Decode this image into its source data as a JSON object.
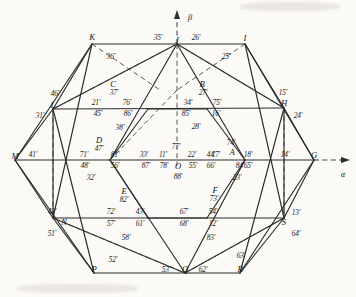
{
  "figure": {
    "type": "geometry-diagram",
    "axes": {
      "vertical": {
        "label": "β",
        "name": "beta-axis"
      },
      "horizontal": {
        "label": "α",
        "name": "alpha-axis"
      }
    },
    "vertices": [
      {
        "id": "K",
        "label": "K",
        "x": 92,
        "y": 37
      },
      {
        "id": "J",
        "label": "J",
        "x": 177,
        "y": 40
      },
      {
        "id": "I",
        "label": "I",
        "x": 245,
        "y": 38
      },
      {
        "id": "L",
        "label": "L",
        "x": 53,
        "y": 105
      },
      {
        "id": "C",
        "label": "C",
        "x": 113,
        "y": 84
      },
      {
        "id": "B",
        "label": "B",
        "x": 202,
        "y": 84
      },
      {
        "id": "H",
        "label": "H",
        "x": 284,
        "y": 103
      },
      {
        "id": "M",
        "label": "M",
        "x": 15,
        "y": 156
      },
      {
        "id": "D",
        "label": "D",
        "x": 99,
        "y": 140
      },
      {
        "id": "A",
        "label": "A",
        "x": 232,
        "y": 152
      },
      {
        "id": "O",
        "label": "O",
        "x": 178,
        "y": 166
      },
      {
        "id": "G",
        "label": "G",
        "x": 314,
        "y": 155
      },
      {
        "id": "E",
        "label": "E",
        "x": 124,
        "y": 191
      },
      {
        "id": "F",
        "label": "F",
        "x": 215,
        "y": 190
      },
      {
        "id": "N",
        "label": "N",
        "x": 64,
        "y": 222
      },
      {
        "id": "S",
        "label": "S",
        "x": 284,
        "y": 222
      },
      {
        "id": "P",
        "label": "P",
        "x": 94,
        "y": 269
      },
      {
        "id": "Q",
        "label": "Q",
        "x": 185,
        "y": 269
      },
      {
        "id": "R",
        "label": "R",
        "x": 240,
        "y": 269
      }
    ],
    "member_labels": [
      {
        "text": "35'",
        "x": 158,
        "y": 38
      },
      {
        "text": "26'",
        "x": 196,
        "y": 38
      },
      {
        "text": "36'",
        "x": 111,
        "y": 57
      },
      {
        "text": "25'",
        "x": 226,
        "y": 57
      },
      {
        "text": "37'",
        "x": 114,
        "y": 93
      },
      {
        "text": "27'",
        "x": 203,
        "y": 93
      },
      {
        "text": "46'",
        "x": 55,
        "y": 94
      },
      {
        "text": "15'",
        "x": 283,
        "y": 93
      },
      {
        "text": "21'",
        "x": 96,
        "y": 103
      },
      {
        "text": "76'",
        "x": 127,
        "y": 103
      },
      {
        "text": "34'",
        "x": 188,
        "y": 103
      },
      {
        "text": "75'",
        "x": 217,
        "y": 103
      },
      {
        "text": "31'",
        "x": 40,
        "y": 116
      },
      {
        "text": "24'",
        "x": 298,
        "y": 116
      },
      {
        "text": "45'",
        "x": 98,
        "y": 114
      },
      {
        "text": "86'",
        "x": 128,
        "y": 114
      },
      {
        "text": "85'",
        "x": 186,
        "y": 114
      },
      {
        "text": "16'",
        "x": 216,
        "y": 114
      },
      {
        "text": "38'",
        "x": 120,
        "y": 128
      },
      {
        "text": "28'",
        "x": 196,
        "y": 127
      },
      {
        "text": "47'",
        "x": 99,
        "y": 149
      },
      {
        "text": "74'",
        "x": 231,
        "y": 143
      },
      {
        "text": "77'",
        "x": 176,
        "y": 147
      },
      {
        "text": "41'",
        "x": 33,
        "y": 155
      },
      {
        "text": "71'",
        "x": 84,
        "y": 155
      },
      {
        "text": "81'",
        "x": 115,
        "y": 155
      },
      {
        "text": "33'",
        "x": 144,
        "y": 155
      },
      {
        "text": "11'",
        "x": 163,
        "y": 155
      },
      {
        "text": "22'",
        "x": 192,
        "y": 155
      },
      {
        "text": "44'",
        "x": 211,
        "y": 155
      },
      {
        "text": "17'",
        "x": 216,
        "y": 155
      },
      {
        "text": "18'",
        "x": 248,
        "y": 155
      },
      {
        "text": "14'",
        "x": 285,
        "y": 155
      },
      {
        "text": "48'",
        "x": 85,
        "y": 166
      },
      {
        "text": "56'",
        "x": 115,
        "y": 166
      },
      {
        "text": "87'",
        "x": 146,
        "y": 166
      },
      {
        "text": "78'",
        "x": 164,
        "y": 166
      },
      {
        "text": "55'",
        "x": 193,
        "y": 166
      },
      {
        "text": "66'",
        "x": 211,
        "y": 166
      },
      {
        "text": "84'",
        "x": 240,
        "y": 166
      },
      {
        "text": "65'",
        "x": 248,
        "y": 166
      },
      {
        "text": "32'",
        "x": 91,
        "y": 178
      },
      {
        "text": "88'",
        "x": 178,
        "y": 177
      },
      {
        "text": "23'",
        "x": 237,
        "y": 178
      },
      {
        "text": "82'",
        "x": 124,
        "y": 200
      },
      {
        "text": "73'",
        "x": 214,
        "y": 199
      },
      {
        "text": "42'",
        "x": 52,
        "y": 212
      },
      {
        "text": "13'",
        "x": 296,
        "y": 213
      },
      {
        "text": "72'",
        "x": 111,
        "y": 212
      },
      {
        "text": "43'",
        "x": 140,
        "y": 212
      },
      {
        "text": "67'",
        "x": 184,
        "y": 212
      },
      {
        "text": "54'",
        "x": 213,
        "y": 212
      },
      {
        "text": "57'",
        "x": 111,
        "y": 224
      },
      {
        "text": "61'",
        "x": 140,
        "y": 224
      },
      {
        "text": "68'",
        "x": 184,
        "y": 224
      },
      {
        "text": "12'",
        "x": 213,
        "y": 224
      },
      {
        "text": "51'",
        "x": 52,
        "y": 234
      },
      {
        "text": "64'",
        "x": 296,
        "y": 234
      },
      {
        "text": "58'",
        "x": 126,
        "y": 238
      },
      {
        "text": "83'",
        "x": 211,
        "y": 238
      },
      {
        "text": "63'",
        "x": 241,
        "y": 256
      },
      {
        "text": "52'",
        "x": 113,
        "y": 260
      },
      {
        "text": "53'",
        "x": 166,
        "y": 270
      },
      {
        "text": "62'",
        "x": 203,
        "y": 270
      }
    ]
  }
}
